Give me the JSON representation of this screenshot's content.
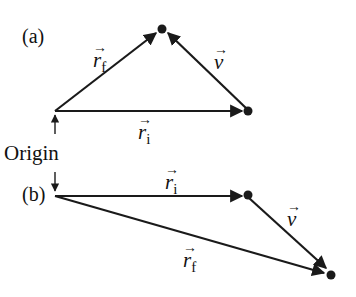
{
  "diagram": {
    "panel_a": {
      "label": "(a)",
      "r_initial": {
        "symbol": "r",
        "subscript": "i",
        "arrow": "→"
      },
      "r_final": {
        "symbol": "r",
        "subscript": "f",
        "arrow": "→"
      },
      "displacement": {
        "symbol": "v",
        "arrow": "→"
      }
    },
    "origin_label": "Origin",
    "panel_b": {
      "label": "(b)",
      "r_initial": {
        "symbol": "r",
        "subscript": "i",
        "arrow": "→"
      },
      "r_final": {
        "symbol": "r",
        "subscript": "f",
        "arrow": "→"
      },
      "displacement": {
        "symbol": "v",
        "arrow": "→"
      }
    },
    "colors": {
      "line": "#1a1a1a",
      "background": "#ffffff"
    }
  }
}
